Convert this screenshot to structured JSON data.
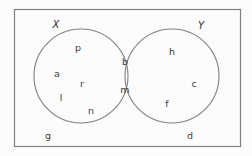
{
  "figure": {
    "type": "venn-diagram",
    "background_color": "#fcfcfc",
    "stroke_color": "#808080",
    "text_color": "#3d3d3d",
    "universe": {
      "name": "universal-set-rectangle",
      "x": 14,
      "y": 9,
      "width": 226,
      "height": 137
    },
    "circles": [
      {
        "name": "circle-x",
        "cx": 81,
        "cy": 76,
        "r": 47
      },
      {
        "name": "circle-y",
        "cx": 172,
        "cy": 76,
        "r": 47
      }
    ]
  },
  "set_labels": [
    {
      "name": "set-label-x",
      "text": "X",
      "x": 56,
      "y": 25
    },
    {
      "name": "set-label-y",
      "text": "Y",
      "x": 201,
      "y": 26
    }
  ],
  "elements": [
    {
      "name": "element-p",
      "text": "p",
      "region": "x-only",
      "x": 78,
      "y": 48
    },
    {
      "name": "element-a",
      "text": "a",
      "region": "x-only",
      "x": 57,
      "y": 74
    },
    {
      "name": "element-r",
      "text": "r",
      "region": "x-only",
      "x": 82,
      "y": 84
    },
    {
      "name": "element-l",
      "text": "l",
      "region": "x-only",
      "x": 61,
      "y": 98
    },
    {
      "name": "element-n",
      "text": "n",
      "region": "x-only",
      "x": 91,
      "y": 111
    },
    {
      "name": "element-b",
      "text": "b",
      "region": "intersection",
      "x": 125,
      "y": 62
    },
    {
      "name": "element-m",
      "text": "m",
      "region": "intersection",
      "x": 125,
      "y": 90
    },
    {
      "name": "element-h",
      "text": "h",
      "region": "y-only",
      "x": 172,
      "y": 52
    },
    {
      "name": "element-c",
      "text": "c",
      "region": "y-only",
      "x": 194,
      "y": 84
    },
    {
      "name": "element-f",
      "text": "f",
      "region": "y-only",
      "x": 167,
      "y": 104
    },
    {
      "name": "element-g",
      "text": "g",
      "region": "outside",
      "x": 48,
      "y": 136
    },
    {
      "name": "element-d",
      "text": "d",
      "region": "outside",
      "x": 190,
      "y": 136
    }
  ],
  "set_contents": {
    "x_only": [
      "p",
      "a",
      "r",
      "l",
      "n"
    ],
    "intersection": [
      "b",
      "m"
    ],
    "y_only": [
      "h",
      "c",
      "f"
    ],
    "outside_both": [
      "g",
      "d"
    ]
  }
}
